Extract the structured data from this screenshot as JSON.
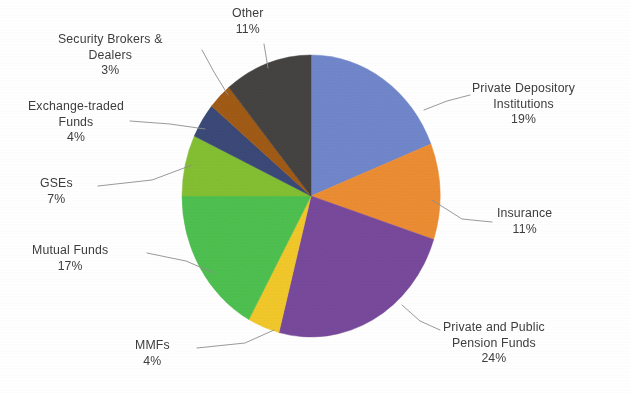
{
  "chart_data": {
    "type": "pie",
    "title": "",
    "subtitle": "",
    "xlabel": "",
    "ylabel": "",
    "legend_position": "callout-labels",
    "grid": false,
    "label_format": "name + percent",
    "start_angle_deg": 0,
    "direction": "clockwise",
    "categories": [
      "Private Depository Institutions",
      "Insurance",
      "Private and Public Pension Funds",
      "MMFs",
      "Mutual Funds",
      "GSEs",
      "Exchange-traded Funds",
      "Security Brokers & Dealers",
      "Other"
    ],
    "values": [
      19,
      11,
      24,
      4,
      17,
      7,
      4,
      3,
      11
    ],
    "unit": "%",
    "colors": [
      "#7289ce",
      "#ef8f34",
      "#7a4a9e",
      "#f5cb2b",
      "#4fc351",
      "#86c232",
      "#3b4a7a",
      "#a35c13",
      "#464443"
    ],
    "slices": [
      {
        "label": "Private Depository Institutions",
        "value": 19,
        "percent_text": "19%",
        "color": "#7289ce"
      },
      {
        "label": "Insurance",
        "value": 11,
        "percent_text": "11%",
        "color": "#ef8f34"
      },
      {
        "label": "Private and Public Pension Funds",
        "value": 24,
        "percent_text": "24%",
        "color": "#7a4a9e"
      },
      {
        "label": "MMFs",
        "value": 4,
        "percent_text": "4%",
        "color": "#f5cb2b"
      },
      {
        "label": "Mutual Funds",
        "value": 17,
        "percent_text": "17%",
        "color": "#4fc351"
      },
      {
        "label": "GSEs",
        "value": 7,
        "percent_text": "7%",
        "color": "#86c232"
      },
      {
        "label": "Exchange-traded Funds",
        "value": 4,
        "percent_text": "4%",
        "color": "#3b4a7a"
      },
      {
        "label": "Security Brokers & Dealers",
        "value": 3,
        "percent_text": "3%",
        "color": "#a35c13"
      },
      {
        "label": "Other",
        "value": 11,
        "percent_text": "11%",
        "color": "#464443"
      }
    ]
  },
  "labels": {
    "private_depository": {
      "line1": "Private Depository",
      "line2": "Institutions",
      "pct": "19%"
    },
    "insurance": {
      "line1": "Insurance",
      "line2": "",
      "pct": "11%"
    },
    "pension": {
      "line1": "Private and Public",
      "line2": "Pension Funds",
      "pct": "24%"
    },
    "mmfs": {
      "line1": "MMFs",
      "line2": "",
      "pct": "4%"
    },
    "mutual_funds": {
      "line1": "Mutual Funds",
      "line2": "",
      "pct": "17%"
    },
    "gses": {
      "line1": "GSEs",
      "line2": "",
      "pct": "7%"
    },
    "etf": {
      "line1": "Exchange-traded",
      "line2": "Funds",
      "pct": "4%"
    },
    "security_brokers": {
      "line1": "Security Brokers &",
      "line2": "Dealers",
      "pct": "3%"
    },
    "other": {
      "line1": "Other",
      "line2": "",
      "pct": "11%"
    }
  }
}
